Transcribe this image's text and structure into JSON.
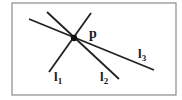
{
  "diagram": {
    "frame": {
      "x": 12,
      "y": 3,
      "width": 164,
      "height": 92,
      "stroke": "#8a8a8a"
    },
    "point": {
      "label": "p",
      "x": 74,
      "y": 38,
      "r": 3.2,
      "color": "#111111"
    },
    "lines": [
      {
        "name": "l1",
        "label": "l",
        "subscript": "1",
        "x1": 91,
        "y1": 13,
        "x2": 49,
        "y2": 72,
        "label_x": 54,
        "label_y": 81
      },
      {
        "name": "l2",
        "label": "l",
        "subscript": "2",
        "x1": 47,
        "y1": 12,
        "x2": 119,
        "y2": 79,
        "label_x": 100,
        "label_y": 81
      },
      {
        "name": "l3",
        "label": "l",
        "subscript": "3",
        "x1": 29,
        "y1": 19,
        "x2": 154,
        "y2": 70,
        "label_x": 138,
        "label_y": 58
      }
    ],
    "point_label": {
      "text": "p",
      "x": 89,
      "y": 38
    },
    "line_color": "#222222"
  }
}
